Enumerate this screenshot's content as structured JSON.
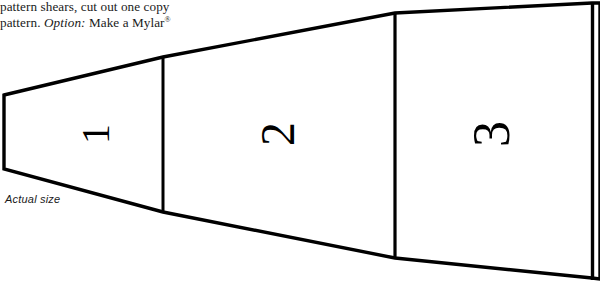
{
  "page": {
    "width": 600,
    "height": 288,
    "background_color": "#ffffff",
    "ink_color": "#000000"
  },
  "caption": {
    "line1": "pattern shears, cut out one copy",
    "line2_part1": "pattern. ",
    "line2_italic": "Option:",
    "line2_part2": " Make a Mylar",
    "line2_superscript": "®"
  },
  "annotations": {
    "actual_size_label": "Actual size"
  },
  "pattern": {
    "name": "tapered-three-segment-template",
    "stroke_color": "#000000",
    "fill_color": "#ffffff",
    "segments": [
      {
        "number": "1",
        "label": "segment-one"
      },
      {
        "number": "2",
        "label": "segment-two"
      },
      {
        "number": "3",
        "label": "segment-three"
      }
    ],
    "numeral_rotation_degrees": -90,
    "outline_points": [
      [
        4,
        95
      ],
      [
        163,
        57
      ],
      [
        395,
        13
      ],
      [
        592,
        3
      ],
      [
        592,
        278
      ],
      [
        395,
        258
      ],
      [
        163,
        212
      ],
      [
        4,
        169
      ]
    ],
    "divider_lines": [
      {
        "name": "divider-1",
        "x": 163,
        "y_top": 57,
        "y_bottom": 212
      },
      {
        "name": "divider-2",
        "x": 395,
        "y_top": 13,
        "y_bottom": 258
      }
    ]
  }
}
